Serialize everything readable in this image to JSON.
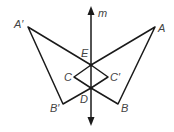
{
  "diagram": {
    "type": "reflection",
    "line": {
      "label": "m"
    },
    "points": {
      "A_prime": {
        "label": "A′",
        "x": 28,
        "y": 27
      },
      "A": {
        "label": "A",
        "x": 155,
        "y": 27
      },
      "E": {
        "label": "E",
        "x": 91,
        "y": 65
      },
      "C": {
        "label": "C",
        "x": 74,
        "y": 77
      },
      "C_prime": {
        "label": "C′",
        "x": 108,
        "y": 77
      },
      "D": {
        "label": "D",
        "x": 91,
        "y": 88
      },
      "B_prime": {
        "label": "B′",
        "x": 63,
        "y": 104
      },
      "B": {
        "label": "B",
        "x": 118,
        "y": 104
      }
    },
    "colors": {
      "stroke": "#1a1a1a",
      "label": "#444444"
    }
  }
}
